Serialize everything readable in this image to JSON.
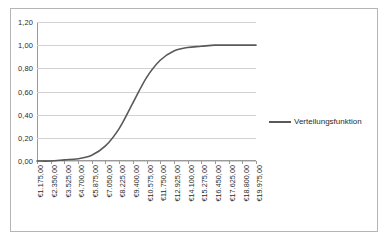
{
  "chart_data": {
    "type": "line",
    "title": "",
    "xlabel": "",
    "ylabel": "",
    "ylim": [
      0,
      1.2
    ],
    "ytick_labels": [
      "0,00",
      "0,20",
      "0,40",
      "0,60",
      "0,80",
      "1,00",
      "1,20"
    ],
    "ytick_values": [
      0,
      0.2,
      0.4,
      0.6,
      0.8,
      1.0,
      1.2
    ],
    "grid": true,
    "legend_position": "right",
    "categories": [
      "€1.175,00",
      "€2.350,00",
      "€3.525,00",
      "€4.700,00",
      "€5.875,00",
      "€7.050,00",
      "€8.225,00",
      "€9.400,00",
      "€10.575,00",
      "€11.750,00",
      "€12.925,00",
      "€14.100,00",
      "€15.275,00",
      "€16.450,00",
      "€17.625,00",
      "€18.800,00",
      "€19.975,00"
    ],
    "x_numeric": [
      1175,
      2350,
      3525,
      4700,
      5875,
      7050,
      8225,
      9400,
      10575,
      11750,
      12925,
      14100,
      15275,
      16450,
      17625,
      18800,
      19975
    ],
    "series": [
      {
        "name": "Verteilungsfunktion",
        "color": "#595959",
        "values": [
          0.0,
          0.0,
          0.01,
          0.02,
          0.05,
          0.13,
          0.28,
          0.5,
          0.72,
          0.87,
          0.95,
          0.98,
          0.99,
          1.0,
          1.0,
          1.0,
          1.0
        ]
      }
    ]
  },
  "legend": {
    "entries": [
      {
        "label": "Verteilungsfunktion",
        "color": "#595959"
      }
    ]
  },
  "colors": {
    "series_line": "#595959",
    "gridline": "#d2d2d2",
    "axis": "#9a9a9a",
    "border": "#b5b5b5",
    "text": "#2b2b2b"
  }
}
